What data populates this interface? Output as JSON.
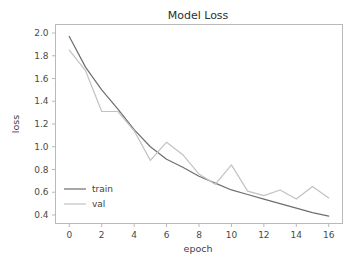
{
  "figure": {
    "background_color": "#ffffff",
    "axes_color": "#b9b9b9"
  },
  "chart_data": {
    "type": "line",
    "title": "Model Loss",
    "xlabel": "epoch",
    "ylabel": "loss",
    "x": [
      0,
      1,
      2,
      3,
      4,
      5,
      6,
      7,
      8,
      9,
      10,
      11,
      12,
      13,
      14,
      15,
      16
    ],
    "xticks": [
      0,
      2,
      4,
      6,
      8,
      10,
      12,
      14,
      16
    ],
    "xtick_labels": [
      "0",
      "2",
      "4",
      "6",
      "8",
      "10",
      "12",
      "14",
      "16"
    ],
    "yticks": [
      0.4,
      0.6,
      0.8,
      1.0,
      1.2,
      1.4,
      1.6,
      1.8,
      2.0
    ],
    "ytick_labels": [
      "0.4",
      "0.6",
      "0.8",
      "1.0",
      "1.2",
      "1.4",
      "1.6",
      "1.8",
      "2.0"
    ],
    "xlim": [
      -0.85,
      16.85
    ],
    "ylim": [
      0.325,
      2.075
    ],
    "grid": false,
    "legend_position": "lower left",
    "legend_frame": false,
    "series": [
      {
        "name": "train",
        "color": "#6e6e6e",
        "values": [
          1.97,
          1.7,
          1.5,
          1.33,
          1.15,
          1.0,
          0.89,
          0.82,
          0.74,
          0.68,
          0.62,
          0.58,
          0.54,
          0.5,
          0.46,
          0.42,
          0.39
        ]
      },
      {
        "name": "val",
        "color": "#c2c2c2",
        "values": [
          1.85,
          1.67,
          1.31,
          1.31,
          1.14,
          0.88,
          1.04,
          0.93,
          0.76,
          0.67,
          0.84,
          0.61,
          0.57,
          0.62,
          0.54,
          0.65,
          0.55
        ]
      }
    ]
  },
  "legend": {
    "entries": [
      {
        "label": "train",
        "color": "#6e6e6e"
      },
      {
        "label": "val",
        "color": "#c2c2c2"
      }
    ]
  }
}
